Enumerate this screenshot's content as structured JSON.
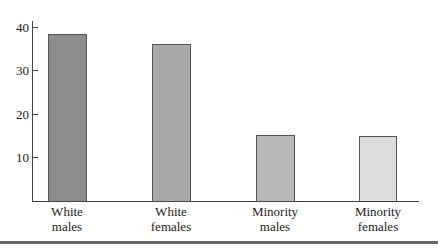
{
  "chart_data": {
    "type": "bar",
    "title": "",
    "xlabel": "",
    "ylabel": "",
    "categories": [
      "White males",
      "White females",
      "Minority males",
      "Minority females"
    ],
    "category_lines": [
      [
        "White",
        "males"
      ],
      [
        "White",
        "females"
      ],
      [
        "Minority",
        "males"
      ],
      [
        "Minority",
        "females"
      ]
    ],
    "values": [
      38.4,
      36.1,
      15.2,
      15.0
    ],
    "colors": [
      "#8c8c8c",
      "#a9a9a9",
      "#b8b8b8",
      "#dcdcdc"
    ],
    "ylim": [
      0,
      41
    ],
    "yticks": [
      10,
      20,
      30,
      40
    ],
    "grid": false,
    "legend": null
  }
}
